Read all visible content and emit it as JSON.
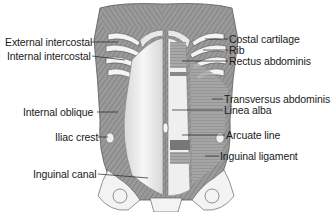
{
  "figure": {
    "left_labels": [
      {
        "text": "External intercostal",
        "x": 5,
        "y": 37
      },
      {
        "text": "Internal intercostal",
        "x": 7,
        "y": 51
      },
      {
        "text": "Internal  oblique",
        "x": 23,
        "y": 107
      },
      {
        "text": "Iliac crest",
        "x": 55,
        "y": 132
      },
      {
        "text": "Inguinal canal",
        "x": 33,
        "y": 169
      }
    ],
    "right_labels": [
      {
        "text": "Costal cartilage",
        "x": 229,
        "y": 34
      },
      {
        "text": "Rib",
        "x": 229,
        "y": 45
      },
      {
        "text": "Rectus abdominis",
        "x": 229,
        "y": 56
      },
      {
        "text": "Transversus abdominis",
        "x": 224,
        "y": 94
      },
      {
        "text": "Linea alba",
        "x": 224,
        "y": 105
      },
      {
        "text": "Arcuate line",
        "x": 226,
        "y": 130
      },
      {
        "text": "Inguinal ligament",
        "x": 220,
        "y": 151
      }
    ],
    "colors": {
      "muscle": "#8e8e8e",
      "muscle_light": "#c9c9c9",
      "bone": "#efefef",
      "outline": "#5a5a5a",
      "leader": "#333333"
    }
  }
}
